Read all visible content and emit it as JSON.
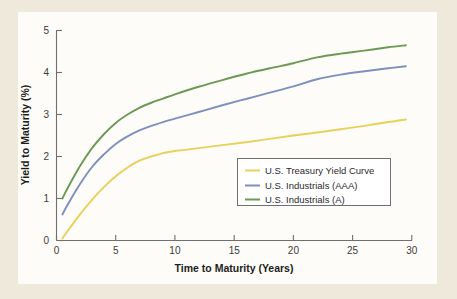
{
  "chart_data": {
    "type": "line",
    "title": "",
    "xlabel": "Time to Maturity (Years)",
    "ylabel": "Yield to Maturity (%)",
    "xlim": [
      0,
      30
    ],
    "ylim": [
      0,
      5
    ],
    "xticks": [
      "0",
      "5",
      "10",
      "15",
      "20",
      "25",
      "30"
    ],
    "yticks": [
      "0",
      "1",
      "2",
      "3",
      "4",
      "5"
    ],
    "grid": false,
    "legend_position": "lower-right-inside",
    "x": [
      0.5,
      1,
      2,
      3,
      4,
      5,
      6,
      7,
      8,
      9,
      10,
      12,
      14,
      16,
      18,
      20,
      22,
      24,
      26,
      28,
      29.5
    ],
    "series": [
      {
        "name": "U.S. Treasury Yield Curve",
        "color": "#e8d05a",
        "values": [
          0.05,
          0.25,
          0.63,
          0.97,
          1.27,
          1.53,
          1.74,
          1.9,
          2.0,
          2.08,
          2.13,
          2.2,
          2.27,
          2.34,
          2.42,
          2.5,
          2.57,
          2.65,
          2.73,
          2.82,
          2.88
        ]
      },
      {
        "name": "U.S. Industrials (AAA)",
        "color": "#7e8fc0",
        "values": [
          0.62,
          0.88,
          1.35,
          1.75,
          2.05,
          2.3,
          2.48,
          2.62,
          2.73,
          2.82,
          2.9,
          3.06,
          3.22,
          3.37,
          3.52,
          3.67,
          3.84,
          3.95,
          4.03,
          4.1,
          4.15
        ]
      },
      {
        "name": "U.S. Industrials (A)",
        "color": "#6b9a54",
        "values": [
          1.0,
          1.28,
          1.78,
          2.2,
          2.53,
          2.8,
          3.0,
          3.16,
          3.28,
          3.38,
          3.48,
          3.66,
          3.82,
          3.97,
          4.1,
          4.22,
          4.36,
          4.45,
          4.52,
          4.6,
          4.65
        ]
      }
    ]
  },
  "legend": {
    "items": [
      {
        "label": "U.S. Treasury Yield Curve",
        "color": "#e8d05a"
      },
      {
        "label": "U.S. Industrials (AAA)",
        "color": "#7e8fc0"
      },
      {
        "label": "U.S. Industrials (A)",
        "color": "#6b9a54"
      }
    ]
  },
  "colors": {
    "page_background": "#efe9dc",
    "plot_background": "#fdfcf8",
    "axis": "#6f6f6f",
    "text": "#2b2b2b"
  }
}
